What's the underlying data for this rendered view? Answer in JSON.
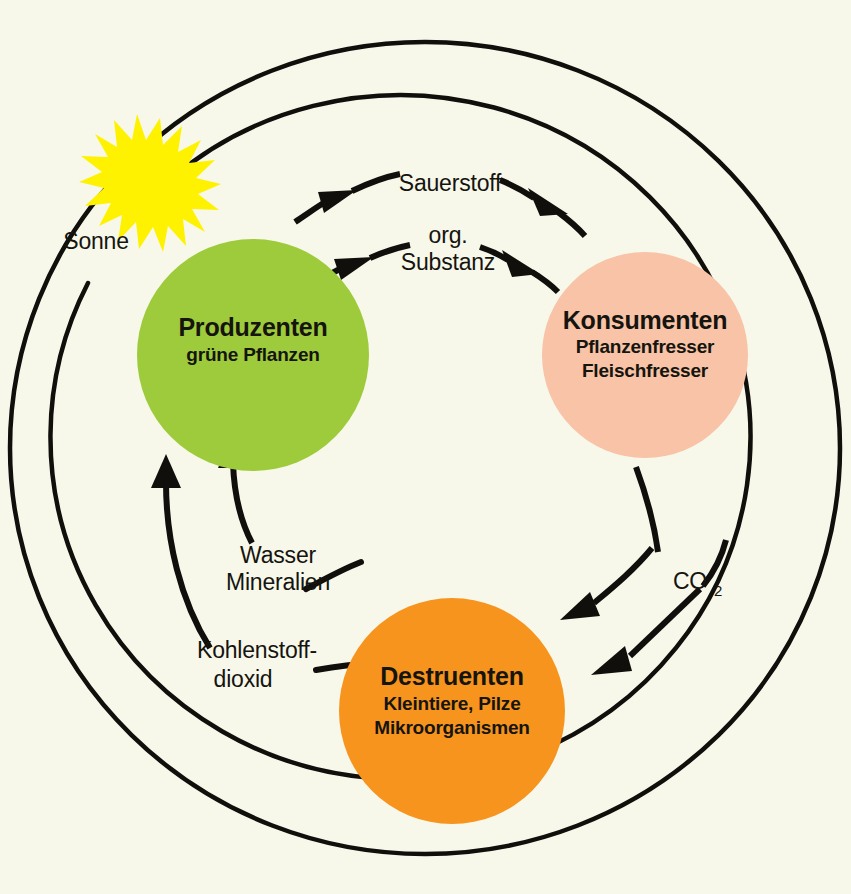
{
  "diagram": {
    "background_color": "#F7F8EA",
    "line_color": "#100F0B"
  },
  "sun": {
    "label": "Sonne",
    "color": "#FFF200",
    "icon": "sun-starburst-icon"
  },
  "nodes": [
    {
      "id": "produzenten",
      "title": "Produzenten",
      "sub1": "grüne Pflanzen",
      "sub2": "",
      "color": "#9ECB3B"
    },
    {
      "id": "konsumenten",
      "title": "Konsumenten",
      "sub1": "Pflanzenfresser",
      "sub2": "Fleischfresser",
      "color": "#F8C3A6"
    },
    {
      "id": "destruenten",
      "title": "Destruenten",
      "sub1": "Kleintiere, Pilze",
      "sub2": "Mikroorganismen",
      "color": "#F7941E"
    }
  ],
  "flows": {
    "sauerstoff": "Sauerstoff",
    "org_line1": "org.",
    "org_line2": "Substanz",
    "wasser": "Wasser",
    "mineralien": "Mineralien",
    "kohlenstoff_line1": "Kohlenstoff-",
    "kohlenstoff_line2": "dioxid",
    "co2": "CO",
    "co2_sub": "2"
  }
}
